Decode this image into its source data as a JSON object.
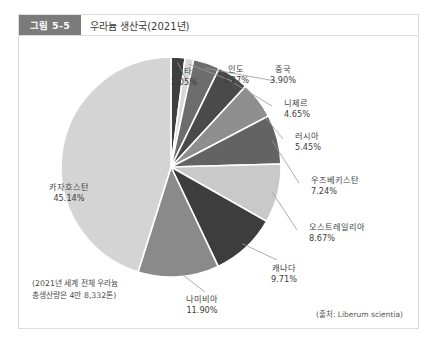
{
  "figure": {
    "badge": "그림 5-5",
    "title": "우라늄 생산국(2021년)"
  },
  "note": {
    "line1": "(2021년 세계 전체 우라늄",
    "line2": "총생산량은 4만 8,332톤)"
  },
  "source": "(출처: Liberum scientia)",
  "chart_data": {
    "type": "pie",
    "title": "우라늄 생산국(2021년)",
    "unit": "%",
    "start_angle_deg": -90,
    "direction": "clockwise",
    "legend": "none (direct labels with leader lines)",
    "categories": [
      "기타",
      "인도",
      "중국",
      "니제르",
      "러시아",
      "우즈베키스탄",
      "오스트레일리아",
      "캐나다",
      "나미비아",
      "카자흐스탄"
    ],
    "values": [
      2.05,
      1.27,
      3.9,
      4.65,
      5.45,
      7.24,
      8.67,
      9.71,
      11.9,
      45.14
    ],
    "labels": [
      {
        "name": "기타",
        "value": "2.05%",
        "color": "#3f3f3f"
      },
      {
        "name": "인도",
        "value": "1.27%",
        "color": "#d8d8d8"
      },
      {
        "name": "중국",
        "value": "3.90%",
        "color": "#6d6d6d"
      },
      {
        "name": "니제르",
        "value": "4.65%",
        "color": "#4a4a4a"
      },
      {
        "name": "러시아",
        "value": "5.45%",
        "color": "#8e8e8e"
      },
      {
        "name": "우즈베키스탄",
        "value": "7.24%",
        "color": "#636363"
      },
      {
        "name": "오스트레일리아",
        "value": "8.67%",
        "color": "#c9c9c9"
      },
      {
        "name": "캐나다",
        "value": "9.71%",
        "color": "#3d3d3d"
      },
      {
        "name": "나미비아",
        "value": "11.90%",
        "color": "#8a8a8a"
      },
      {
        "name": "카자흐스탄",
        "value": "45.14%",
        "color": "#d4d4d4"
      }
    ]
  }
}
